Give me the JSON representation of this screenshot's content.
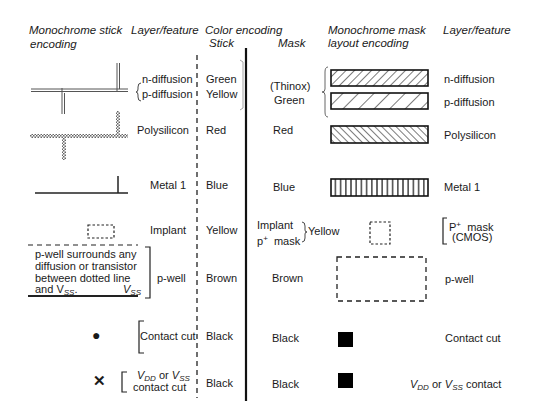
{
  "headers": {
    "mono_stick_line1": "Monochrome stick",
    "mono_stick_line2": "encoding",
    "layer_feature_left": "Layer/feature",
    "color_encoding": "Color encoding",
    "stick": "Stick",
    "mask": "Mask",
    "mono_mask_line1": "Monochrome mask",
    "mono_mask_line2": "layout encoding",
    "layer_feature_right": "Layer/feature"
  },
  "rows": [
    {
      "id": "diffusion",
      "stick_symbol": "double-line",
      "layers_left": [
        "n-diffusion",
        "p-diffusion"
      ],
      "stick_colors": [
        "Green",
        "Yellow"
      ],
      "mask_color_line1": "(Thinox)",
      "mask_color_line2": "Green",
      "mask_patterns": [
        "wide-diagonal-hatch",
        "sparse-diagonal-hatch"
      ],
      "layers_right": [
        "n-diffusion",
        "p-diffusion"
      ]
    },
    {
      "id": "polysilicon",
      "stick_symbol": "checkered-line",
      "layer_left": "Polysilicon",
      "stick_color": "Red",
      "mask_color": "Red",
      "mask_pattern": "back-diagonal-hatch",
      "layer_right": "Polysilicon"
    },
    {
      "id": "metal1",
      "stick_symbol": "solid-line",
      "layer_left": "Metal 1",
      "stick_color": "Blue",
      "mask_color": "Blue",
      "mask_pattern": "vertical-hatch",
      "layer_right": "Metal 1"
    },
    {
      "id": "implant",
      "stick_symbol": "dotted-box",
      "layer_left": "Implant",
      "stick_color": "Yellow",
      "mask_label_line1": "Implant",
      "mask_label_line2_p": "p",
      "mask_label_line2_sup": "+",
      "mask_label_line2_rest": "mask",
      "mask_color": "Yellow",
      "mask_pattern": "dotted-box",
      "layer_right_p": "P",
      "layer_right_sup": "+",
      "layer_right_rest": "mask",
      "layer_right_line2": "(CMOS)"
    },
    {
      "id": "pwell",
      "stick_note_lines": [
        "p-well surrounds any",
        "diffusion or transistor",
        "between dotted line"
      ],
      "stick_note_last_prefix": "and V",
      "stick_note_last_sub": "SS",
      "stick_note_last_dot": ".",
      "stick_note_vss_v": "V",
      "stick_note_vss_sub": "SS",
      "layer_left": "p-well",
      "stick_color": "Brown",
      "mask_color": "Brown",
      "mask_pattern": "dashed-box",
      "layer_right": "p-well"
    },
    {
      "id": "contact",
      "stick_symbol": "dot",
      "layer_left": "Contact cut",
      "stick_color": "Black",
      "mask_color": "Black",
      "mask_pattern": "solid-square",
      "layer_right": "Contact cut"
    },
    {
      "id": "vdd_vss",
      "stick_symbol": "cross",
      "layer_left_v1": "V",
      "layer_left_sub1": "DD",
      "layer_left_or": " or ",
      "layer_left_v2": "V",
      "layer_left_sub2": "SS",
      "layer_left_line2": "contact cut",
      "stick_color": "Black",
      "mask_color": "Black",
      "mask_pattern": "solid-square",
      "layer_right_v1": "V",
      "layer_right_sub1": "DD",
      "layer_right_or": " or ",
      "layer_right_v2": "V",
      "layer_right_sub2": "SS",
      "layer_right_rest": " contact"
    }
  ],
  "symbols": {
    "dot": "●",
    "cross": "✕"
  }
}
